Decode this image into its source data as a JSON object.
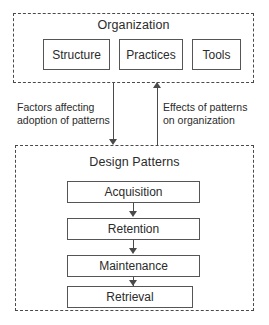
{
  "diagram": {
    "groups": [
      {
        "id": "organization",
        "title": "Organization",
        "nodes": [
          {
            "id": "structure",
            "label": "Structure"
          },
          {
            "id": "practices",
            "label": "Practices"
          },
          {
            "id": "tools",
            "label": "Tools"
          }
        ]
      },
      {
        "id": "design-patterns",
        "title": "Design Patterns",
        "nodes": [
          {
            "id": "acquisition",
            "label": "Acquisition"
          },
          {
            "id": "retention",
            "label": "Retention"
          },
          {
            "id": "maintenance",
            "label": "Maintenance"
          },
          {
            "id": "retrieval",
            "label": "Retrieval"
          }
        ]
      }
    ],
    "edge_labels": {
      "downward": {
        "line1": "Factors affecting",
        "line2": "adoption of patterns"
      },
      "upward": {
        "line1": "Effects of patterns",
        "line2": "on organization"
      }
    },
    "colors": {
      "stroke": "#4a4a4a",
      "node_border": "#555555",
      "text": "#2b2b2b",
      "background": "#ffffff"
    }
  }
}
